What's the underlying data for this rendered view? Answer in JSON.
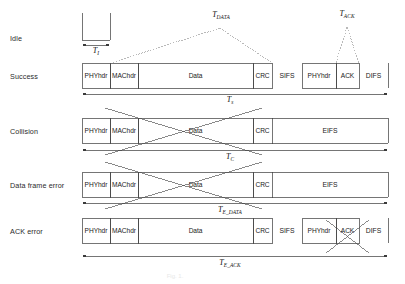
{
  "figure": {
    "caption": "Fig. 1.",
    "stroke_color": "#3a3a3a",
    "dotted_color": "#7a7a7a",
    "cross_color": "#4a4a4a"
  },
  "rows": [
    {
      "id": "idle",
      "label": "Idle"
    },
    {
      "id": "success",
      "label": "Success"
    },
    {
      "id": "collision",
      "label": "Collision"
    },
    {
      "id": "data_frame_error",
      "label": "Data frame error"
    },
    {
      "id": "ack_error",
      "label": "ACK error"
    }
  ],
  "frames": {
    "phyhdr": "PHYhdr",
    "machdr": "MAChdr",
    "data": "Data",
    "crc": "CRC",
    "ack": "ACK",
    "sifs": "SIFS",
    "difs": "DIFS",
    "eifs": "EIFS"
  },
  "durations": {
    "t_idle": {
      "base": "T",
      "sub": "I"
    },
    "t_data": {
      "base": "T",
      "sub": "DATA"
    },
    "t_ack": {
      "base": "T",
      "sub": "ACK"
    },
    "t_s": {
      "base": "T",
      "sub": "s"
    },
    "t_c": {
      "base": "T",
      "sub": "C"
    },
    "t_e_data": {
      "base": "T",
      "sub": "E_DATA"
    },
    "t_e_ack": {
      "base": "T",
      "sub": "E_ACK"
    }
  },
  "row_content": {
    "idle": {
      "segments": [
        "idle-slot"
      ]
    },
    "success": {
      "segments": [
        "PHYhdr",
        "MAChdr",
        "Data",
        "CRC",
        "SIFS",
        "PHYhdr",
        "ACK",
        "DIFS"
      ],
      "duration": "T_s"
    },
    "collision": {
      "segments": [
        "PHYhdr",
        "MAChdr",
        "Data",
        "CRC",
        "EIFS"
      ],
      "duration": "T_C",
      "crossed_out": "Data"
    },
    "data_frame_error": {
      "segments": [
        "PHYhdr",
        "MAChdr",
        "Data",
        "CRC",
        "EIFS"
      ],
      "duration": "T_E_DATA",
      "crossed_out": "Data"
    },
    "ack_error": {
      "segments": [
        "PHYhdr",
        "MAChdr",
        "Data",
        "CRC",
        "SIFS",
        "PHYhdr",
        "ACK",
        "DIFS"
      ],
      "duration": "T_E_ACK",
      "crossed_out": "ACK"
    }
  }
}
